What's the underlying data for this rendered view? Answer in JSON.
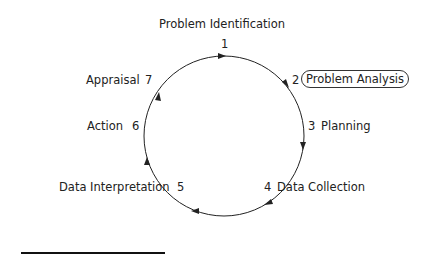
{
  "diagram": {
    "title": "Problem Identification",
    "steps": [
      {
        "num": "1",
        "label": "Problem Identification"
      },
      {
        "num": "2",
        "label": "Problem Analysis",
        "highlighted": true
      },
      {
        "num": "3",
        "label": "Planning"
      },
      {
        "num": "4",
        "label": "Data Collection"
      },
      {
        "num": "5",
        "label": "Data Interpretation"
      },
      {
        "num": "6",
        "label": "Action"
      },
      {
        "num": "7",
        "label": "Appraisal"
      }
    ],
    "cycle_direction": "clockwise",
    "colors": {
      "line": "#222222",
      "text": "#222222"
    }
  }
}
